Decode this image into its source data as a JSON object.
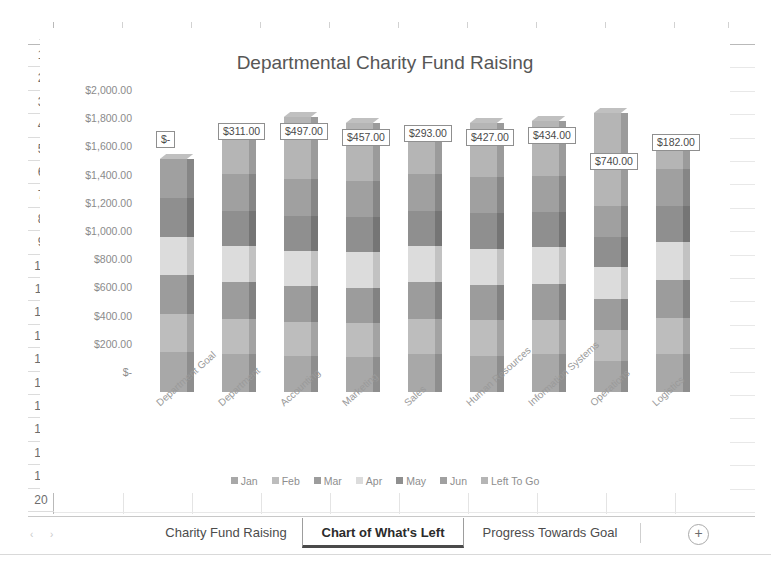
{
  "app": {
    "type": "spreadsheet",
    "columns": [
      "A",
      "B",
      "C",
      "D",
      "E",
      "F",
      "G",
      "H",
      "I",
      "J"
    ],
    "rows": [
      "1",
      "2",
      "3",
      "4",
      "5",
      "6",
      "7",
      "8",
      "9",
      "10",
      "11",
      "12",
      "13",
      "14",
      "15",
      "16",
      "17",
      "18",
      "19",
      "20"
    ],
    "select_all_icon": "select-all-triangle"
  },
  "tabs": {
    "nav_prev_icon": "nav-prev-arrow",
    "nav_next_icon": "nav-next-arrow",
    "items": [
      {
        "label": "Charity Fund Raising",
        "active": false
      },
      {
        "label": "Chart of What's Left",
        "active": true
      },
      {
        "label": "Progress Towards Goal",
        "active": false
      }
    ],
    "add_sheet_label": "+",
    "add_sheet_icon": "plus-circle-icon"
  },
  "chart_data": {
    "type": "bar",
    "subtype": "stacked-column-3d",
    "title": "Departmental Charity Fund Raising",
    "xlabel": "",
    "ylabel": "",
    "ylim": [
      0,
      2000
    ],
    "grid": false,
    "legend_position": "bottom",
    "ytick_labels": [
      "$2,000.00",
      "$1,800.00",
      "$1,600.00",
      "$1,400.00",
      "$1,200.00",
      "$1,000.00",
      "$800.00",
      "$600.00",
      "$400.00",
      "$200.00",
      "$-"
    ],
    "ytick_values": [
      2000,
      1800,
      1600,
      1400,
      1200,
      1000,
      800,
      600,
      400,
      200,
      0
    ],
    "categories": [
      "Department Goal",
      "Department",
      "Accounting",
      "Marketing",
      "Sales",
      "Human Resources",
      "Information Systems",
      "Operations",
      "Logistics"
    ],
    "series": [
      {
        "name": "Jan",
        "color": "#a8a8a8",
        "values": [
          320,
          300,
          290,
          280,
          300,
          290,
          300,
          250,
          300
        ]
      },
      {
        "name": "Feb",
        "color": "#bdbdbd",
        "values": [
          300,
          280,
          270,
          270,
          280,
          280,
          270,
          240,
          290
        ]
      },
      {
        "name": "Mar",
        "color": "#9c9c9c",
        "values": [
          310,
          290,
          280,
          280,
          290,
          280,
          290,
          250,
          300
        ]
      },
      {
        "name": "Apr",
        "color": "#dcdcdc",
        "values": [
          300,
          290,
          280,
          280,
          290,
          290,
          290,
          250,
          300
        ]
      },
      {
        "name": "May",
        "color": "#8f8f8f",
        "values": [
          310,
          280,
          280,
          280,
          280,
          280,
          280,
          240,
          290
        ]
      },
      {
        "name": "Jun",
        "color": "#a0a0a0",
        "values": [
          310,
          290,
          290,
          290,
          290,
          290,
          290,
          250,
          290
        ]
      },
      {
        "name": "Left To Go",
        "color": "#b5b5b5",
        "values": [
          0,
          311,
          497,
          457,
          293,
          427,
          434,
          740,
          182
        ]
      }
    ],
    "data_labels": [
      "$-",
      "$311.00",
      "$497.00",
      "$457.00",
      "$293.00",
      "$427.00",
      "$434.00",
      "$740.00",
      "$182.00"
    ],
    "data_label_values": [
      0,
      311,
      497,
      457,
      293,
      427,
      434,
      740,
      182
    ],
    "totals": [
      1850,
      2041,
      2187,
      2137,
      2023,
      2137,
      2154,
      2220,
      1951
    ]
  }
}
